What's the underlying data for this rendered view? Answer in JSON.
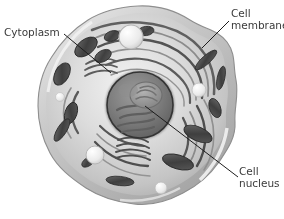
{
  "figure": {
    "kind": "biology-illustration",
    "style": "grayscale-airbrush-render",
    "background_color": "#ffffff",
    "text_color": "#3b3b3b",
    "leader_line_color": "#1d1d1d"
  },
  "labels": [
    {
      "id": "cytoplasm",
      "lines": [
        "Cytoplasm"
      ],
      "text_x": 4,
      "text_y": 27,
      "leader": {
        "x1": 64,
        "y1": 34,
        "x2": 111,
        "y2": 73
      }
    },
    {
      "id": "cell-membrane",
      "lines": [
        "Cell",
        "membrane"
      ],
      "text_x": 231,
      "text_y": 8,
      "leader": {
        "x1": 229,
        "y1": 21,
        "x2": 202,
        "y2": 48
      }
    },
    {
      "id": "cell-nucleus",
      "lines": [
        "Cell",
        "nucleus"
      ],
      "text_x": 239,
      "text_y": 166,
      "leader": {
        "x1": 145,
        "y1": 106,
        "x2": 238,
        "y2": 177
      }
    }
  ],
  "cell": {
    "outline_bbox": {
      "x": 38,
      "y": 5,
      "width": 200,
      "height": 200
    },
    "cytosol_color": "#d8d8d8",
    "membrane_color": "#9a9a9a",
    "nucleus": {
      "center_x": 140,
      "center_y": 105,
      "radius": 33,
      "fill_color": "#7d7d7d",
      "envelope_color": "#3c3c3c",
      "nucleolus_color": "#8e8e8e"
    },
    "organelles": [
      {
        "name": "mitochondrion",
        "count": 12,
        "fill_color": "#4a4a4a"
      },
      {
        "name": "endoplasmic-reticulum",
        "count": 1,
        "fill_color": "#6f6f6f"
      },
      {
        "name": "golgi-apparatus",
        "count": 2,
        "fill_color": "#5a5a5a"
      },
      {
        "name": "vesicle",
        "count": 5,
        "fill_color": "#efefef"
      }
    ]
  }
}
